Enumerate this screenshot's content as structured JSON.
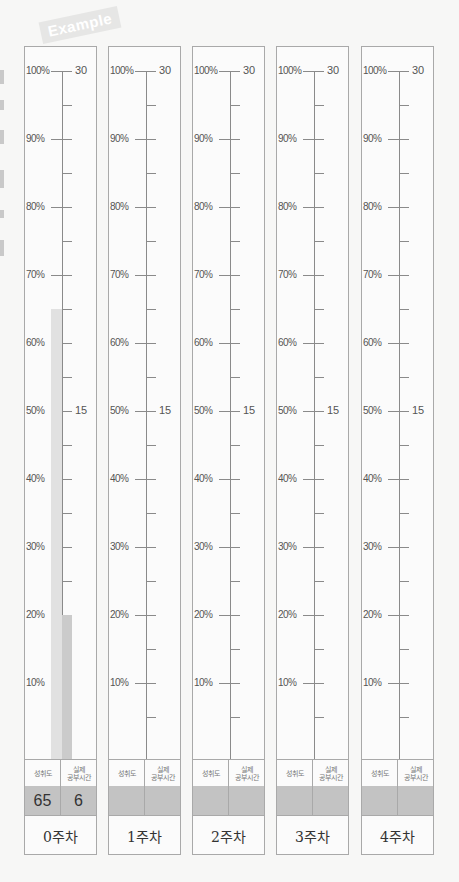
{
  "tag": {
    "label": "Example"
  },
  "axis": {
    "percent_labels": [
      "100%",
      "90%",
      "80%",
      "70%",
      "60%",
      "50%",
      "40%",
      "30%",
      "20%",
      "10%"
    ],
    "hour_labels": [
      "30",
      "25",
      "20",
      "15",
      "10",
      "5"
    ]
  },
  "table_headers": {
    "achievement": "성취도",
    "actual_study_time": "실제\n공부시간"
  },
  "columns": [
    {
      "week_label": "0주차",
      "achievement": "65",
      "hours": "6"
    },
    {
      "week_label": "1주차",
      "achievement": "",
      "hours": ""
    },
    {
      "week_label": "2주차",
      "achievement": "",
      "hours": ""
    },
    {
      "week_label": "3주차",
      "achievement": "",
      "hours": ""
    },
    {
      "week_label": "4주차",
      "achievement": "",
      "hours": ""
    }
  ],
  "colors": {
    "achievement_bar": "#e1e1e1",
    "hours_bar": "#cbcbcb",
    "value_row": "#c3c3c3",
    "border": "#a9a9a9"
  },
  "chart_data": {
    "type": "bar",
    "title": "Example",
    "categories": [
      "0주차",
      "1주차",
      "2주차",
      "3주차",
      "4주차"
    ],
    "series": [
      {
        "name": "성취도 (%)",
        "values": [
          65,
          null,
          null,
          null,
          null
        ],
        "axis": "left",
        "range": [
          0,
          100
        ]
      },
      {
        "name": "실제 공부시간 (hours)",
        "values": [
          6,
          null,
          null,
          null,
          null
        ],
        "axis": "right",
        "range": [
          0,
          30
        ]
      }
    ],
    "left_ticks": [
      10,
      20,
      30,
      40,
      50,
      60,
      70,
      80,
      90,
      100
    ],
    "right_ticks": [
      5,
      10,
      15,
      20,
      25,
      30
    ],
    "right_minor_step": 1.5,
    "grid": false,
    "legend": "none"
  }
}
